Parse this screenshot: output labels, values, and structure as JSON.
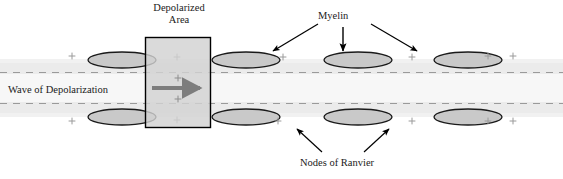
{
  "diagram": {
    "title_labels": {
      "depolarized_area_line1": "Depolarized",
      "depolarized_area_line2": "Area",
      "myelin": "Myelin",
      "wave_of_depolarization": "Wave of Depolarization",
      "nodes_of_ranvier": "Nodes of Ranvier"
    },
    "colors": {
      "background": "#ffffff",
      "axon_band": "#ebebeb",
      "axon_band_edge": "#dcdcdc",
      "myelin_fill": "#c9c9c9",
      "myelin_stroke": "#1a1a1a",
      "depolarized_fill": "#d2d2d2",
      "depolarized_stroke": "#000000",
      "gray_arrow": "#7d7d7d",
      "dashed_line": "#9a9a9a",
      "plus_sign": "#9a9a9a",
      "text": "#1a1a1a",
      "pointer_arrow": "#000000"
    },
    "axon": {
      "band_top": 63,
      "band_bottom": 113,
      "dashed_line_top_y": 72,
      "dashed_line_bottom_y": 103,
      "x_start": 0,
      "x_end": 563
    },
    "myelin_top_row": [
      {
        "cx": 122,
        "cy": 60,
        "rx": 34,
        "ry": 8
      },
      {
        "cx": 246,
        "cy": 60,
        "rx": 34,
        "ry": 8
      },
      {
        "cx": 358,
        "cy": 60,
        "rx": 34,
        "ry": 8
      },
      {
        "cx": 468,
        "cy": 60,
        "rx": 34,
        "ry": 8
      }
    ],
    "myelin_bottom_row": [
      {
        "cx": 122,
        "cy": 117,
        "rx": 34,
        "ry": 8
      },
      {
        "cx": 246,
        "cy": 117,
        "rx": 34,
        "ry": 8
      },
      {
        "cx": 358,
        "cy": 117,
        "rx": 34,
        "ry": 8
      },
      {
        "cx": 468,
        "cy": 117,
        "rx": 34,
        "ry": 8
      }
    ],
    "plus_signs_top": [
      {
        "x": 72,
        "y": 56
      },
      {
        "x": 177,
        "y": 57
      },
      {
        "x": 283,
        "y": 57
      },
      {
        "x": 412,
        "y": 57
      },
      {
        "x": 488,
        "y": 56
      },
      {
        "x": 513,
        "y": 56
      }
    ],
    "plus_signs_bottom": [
      {
        "x": 72,
        "y": 121
      },
      {
        "x": 177,
        "y": 120
      },
      {
        "x": 278,
        "y": 121
      },
      {
        "x": 412,
        "y": 121
      },
      {
        "x": 488,
        "y": 121
      },
      {
        "x": 513,
        "y": 121
      }
    ],
    "plus_signs_inside_box": [
      {
        "x": 178,
        "y": 78
      },
      {
        "x": 178,
        "y": 99
      }
    ],
    "depolarized_box": {
      "x": 145,
      "y": 37,
      "width": 66,
      "height": 91
    },
    "wave_arrow": {
      "x1": 152,
      "y1": 88,
      "x2": 206,
      "y2": 88
    },
    "pointer_arrows": [
      {
        "name": "myelin-arrow-left",
        "x1": 318,
        "y1": 24,
        "x2": 272,
        "y2": 52
      },
      {
        "name": "myelin-arrow-down",
        "x1": 343,
        "y1": 27,
        "x2": 343,
        "y2": 53
      },
      {
        "name": "myelin-arrow-right",
        "x1": 371,
        "y1": 24,
        "x2": 418,
        "y2": 53
      },
      {
        "name": "nodes-arrow-left",
        "x1": 322,
        "y1": 152,
        "x2": 296,
        "y2": 128
      },
      {
        "name": "nodes-arrow-right",
        "x1": 364,
        "y1": 152,
        "x2": 390,
        "y2": 128
      }
    ]
  }
}
